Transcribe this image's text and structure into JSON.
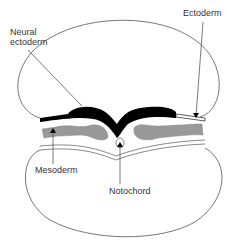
{
  "diagram": {
    "type": "embryo cross-section",
    "labels": {
      "neural_ectoderm_line1": "Neural",
      "neural_ectoderm_line2": "ectoderm",
      "ectoderm": "Ectoderm",
      "mesoderm": "Mesoderm",
      "notochord": "Notochord"
    },
    "colors": {
      "outline": "#555555",
      "neural_ectoderm": "#000000",
      "mesoderm": "#999999",
      "background": "#ffffff"
    }
  }
}
